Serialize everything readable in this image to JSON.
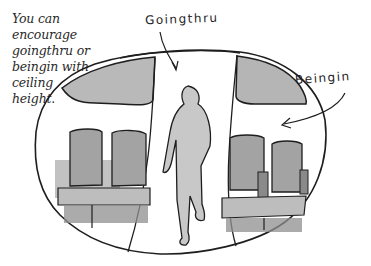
{
  "caption": {
    "lines": [
      "You can",
      "encourage",
      "goingthru or",
      "beingin with",
      "ceiling",
      "height."
    ]
  },
  "labels": {
    "goingthru": "Goingthru",
    "beingin": "Beingin"
  },
  "colors": {
    "ink": "#1e1e1e",
    "wash_dark": "#8f8f8f",
    "wash_mid": "#b4b4b4",
    "wash_light": "#d6d6d6",
    "background": "#ffffff"
  },
  "illustration": {
    "subject": "airplane cabin cross-section",
    "elements": [
      "cabin-oval-outline",
      "left-ceiling-bin",
      "right-ceiling-bin",
      "aisle",
      "walking-person",
      "left-seat-pair",
      "right-seat-pair"
    ]
  }
}
